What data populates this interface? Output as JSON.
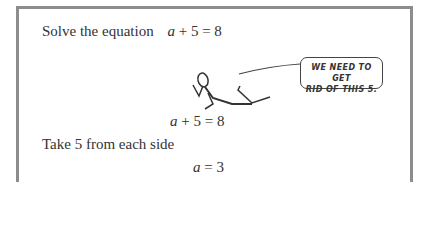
{
  "problem": {
    "prompt": "Solve the equation",
    "equation": {
      "var": "a",
      "plus": "+",
      "num": "5",
      "equals": "=",
      "result": "8"
    }
  },
  "illustration": {
    "speech_bubble": {
      "line1": "WE NEED TO GET",
      "line2": "RID OF THIS 5."
    },
    "figure": "stick-figure-pulling-5"
  },
  "step1": {
    "equation": {
      "var": "a",
      "plus": "+",
      "num": "5",
      "equals": "=",
      "result": "8"
    }
  },
  "step2": {
    "instruction": "Take 5 from each side",
    "equation": {
      "var": "a",
      "equals": "=",
      "result": "3"
    }
  }
}
